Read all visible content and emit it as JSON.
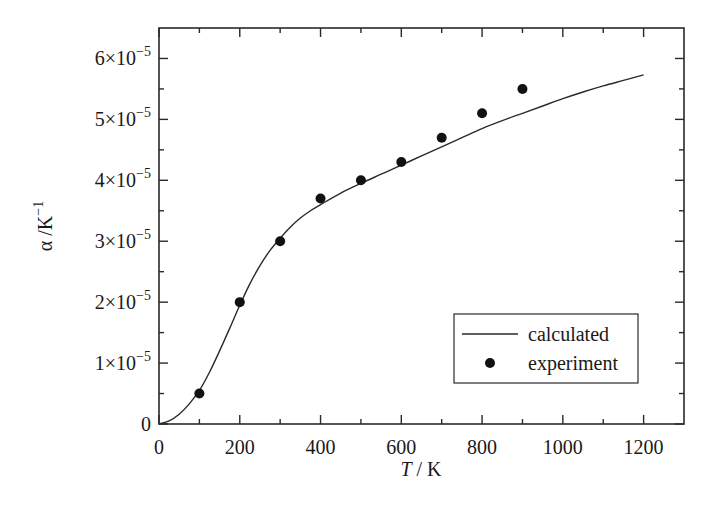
{
  "chart_data": {
    "type": "line",
    "title": "",
    "xlabel": "T / K",
    "xlabel_italic": "T",
    "xlabel_rest": " / K",
    "ylabel": "α /K⁻¹",
    "ylabel_main": "α /K",
    "ylabel_sup": "−1",
    "xlim": [
      0,
      1300
    ],
    "ylim": [
      0,
      6.5e-05
    ],
    "xticks": [
      0,
      200,
      400,
      600,
      800,
      1000,
      1200
    ],
    "xtick_labels": [
      "0",
      "200",
      "400",
      "600",
      "800",
      "1000",
      "1200"
    ],
    "xminor_ticks": [
      100,
      300,
      500,
      700,
      900,
      1100
    ],
    "yticks": [
      0,
      1e-05,
      2e-05,
      3e-05,
      4e-05,
      5e-05,
      6e-05
    ],
    "ytick_labels": [
      {
        "mant": "0",
        "exp": ""
      },
      {
        "mant": "1×10",
        "exp": "−5"
      },
      {
        "mant": "2×10",
        "exp": "−5"
      },
      {
        "mant": "3×10",
        "exp": "−5"
      },
      {
        "mant": "4×10",
        "exp": "−5"
      },
      {
        "mant": "5×10",
        "exp": "−5"
      },
      {
        "mant": "6×10",
        "exp": "−5"
      }
    ],
    "yminor_ticks": [
      5e-06,
      1.5e-05,
      2.5e-05,
      3.5e-05,
      4.5e-05,
      5.5e-05
    ],
    "grid": false,
    "legend_position": "lower right",
    "series": [
      {
        "name": "calculated",
        "style": "line",
        "color": "#2a2a2a",
        "x": [
          0,
          25,
          50,
          75,
          100,
          125,
          150,
          175,
          200,
          225,
          250,
          275,
          300,
          325,
          350,
          375,
          400,
          450,
          500,
          550,
          600,
          650,
          700,
          750,
          800,
          850,
          900,
          950,
          1000,
          1050,
          1100,
          1150,
          1200
        ],
        "y": [
          0,
          5e-07,
          1.6e-06,
          3.3e-06,
          5.5e-06,
          8.5e-06,
          1.2e-05,
          1.57e-05,
          1.95e-05,
          2.3e-05,
          2.6e-05,
          2.85e-05,
          3.05e-05,
          3.23e-05,
          3.38e-05,
          3.5e-05,
          3.6e-05,
          3.79e-05,
          3.95e-05,
          4.1e-05,
          4.25e-05,
          4.4e-05,
          4.55e-05,
          4.7e-05,
          4.85e-05,
          4.98e-05,
          5.1e-05,
          5.22e-05,
          5.34e-05,
          5.45e-05,
          5.55e-05,
          5.64e-05,
          5.73e-05
        ]
      },
      {
        "name": "experiment",
        "style": "scatter",
        "color": "#111111",
        "x": [
          100,
          200,
          300,
          400,
          500,
          600,
          700,
          800,
          900
        ],
        "y": [
          5e-06,
          2e-05,
          3e-05,
          3.7e-05,
          4e-05,
          4.3e-05,
          4.7e-05,
          5.1e-05,
          5.5e-05
        ]
      }
    ],
    "legend": [
      {
        "label": "calculated",
        "marker": "line"
      },
      {
        "label": "experiment",
        "marker": "dot"
      }
    ]
  }
}
